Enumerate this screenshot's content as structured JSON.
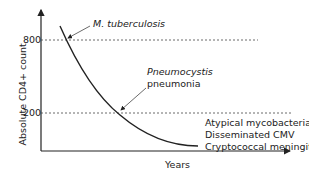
{
  "diagram": {
    "y_axis": {
      "label": "Absolute CD4+ count",
      "ticks": [
        "800",
        "200"
      ]
    },
    "x_axis": {
      "label": "Years"
    },
    "annotations": {
      "tb": "M. tuberculosis",
      "pcp_line1": "Pneumocystis",
      "pcp_line2": "pneumonia",
      "late1": "Atypical mycobacteria",
      "late2": "Disseminated CMV",
      "late3": "Cryptococcal meningitis"
    },
    "colors": {
      "line": "#222222",
      "dashed": "#444444",
      "background": "#ffffff"
    }
  }
}
